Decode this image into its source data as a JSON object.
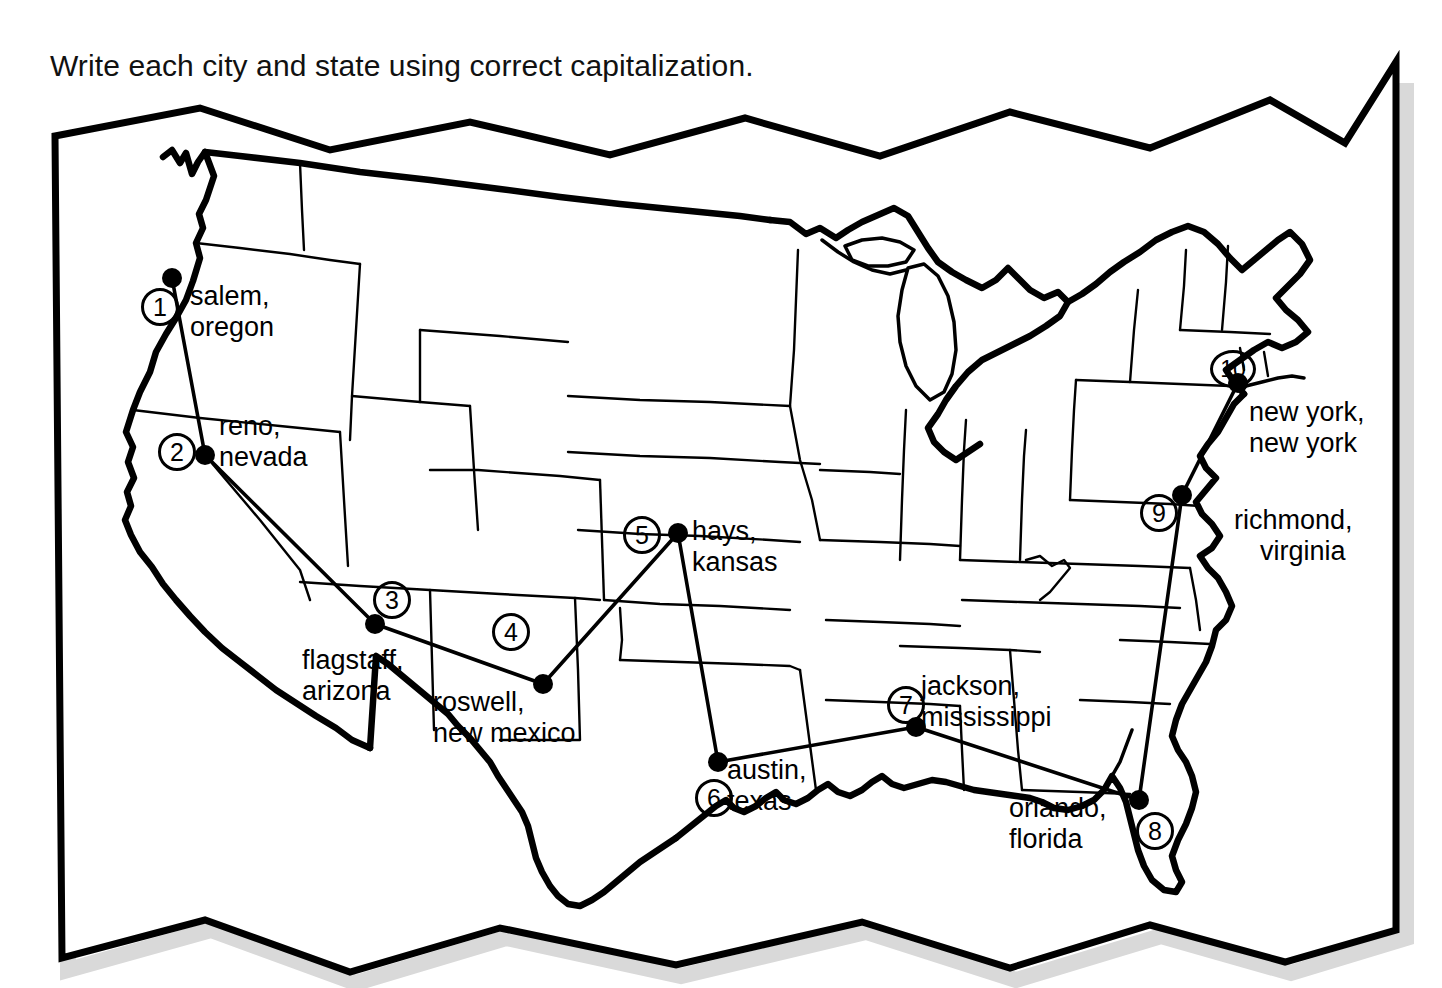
{
  "worksheet": {
    "instruction": "Write each city and state using correct capitalization.",
    "background_color": "#ffffff",
    "ink_color": "#000000"
  },
  "map": {
    "title": "United States outline map",
    "frame_style": "zigzag-banner",
    "markers": [
      {
        "number": "1",
        "city": "salem,",
        "state": "oregon",
        "dot_x": 172,
        "dot_y": 278,
        "badge_x": 141,
        "badge_y": 288,
        "label_x": 190,
        "label_y": 281
      },
      {
        "number": "2",
        "city": "reno,",
        "state": "nevada",
        "dot_x": 205,
        "dot_y": 455,
        "badge_x": 158,
        "badge_y": 433,
        "label_x": 219,
        "label_y": 411
      },
      {
        "number": "3",
        "city": "flagstaff,",
        "state": "arizona",
        "dot_x": 375,
        "dot_y": 624,
        "badge_x": 373,
        "badge_y": 581,
        "label_x": 302,
        "label_y": 645
      },
      {
        "number": "4",
        "city": "roswell,",
        "state": "new mexico",
        "dot_x": 543,
        "dot_y": 684,
        "badge_x": 492,
        "badge_y": 613,
        "label_x": 433,
        "label_y": 687
      },
      {
        "number": "5",
        "city": "hays,",
        "state": "kansas",
        "dot_x": 678,
        "dot_y": 533,
        "badge_x": 623,
        "badge_y": 516,
        "label_x": 692,
        "label_y": 516
      },
      {
        "number": "6",
        "city": "austin,",
        "state": "texas",
        "dot_x": 718,
        "dot_y": 762,
        "badge_x": 695,
        "badge_y": 779,
        "label_x": 727,
        "label_y": 755
      },
      {
        "number": "7",
        "city": "jackson,",
        "state": "mississippi",
        "dot_x": 916,
        "dot_y": 727,
        "badge_x": 887,
        "badge_y": 686,
        "label_x": 921,
        "label_y": 671
      },
      {
        "number": "8",
        "city": "orlando,",
        "state": "florida",
        "dot_x": 1139,
        "dot_y": 800,
        "badge_x": 1136,
        "badge_y": 812,
        "label_x": 1009,
        "label_y": 793
      },
      {
        "number": "9",
        "city": "richmond,",
        "state": "virginia",
        "dot_x": 1182,
        "dot_y": 495,
        "badge_x": 1140,
        "badge_y": 494,
        "label_x": 1234,
        "label_y": 505
      },
      {
        "number": "10",
        "city": "new york,",
        "state": "new york",
        "dot_x": 1238,
        "dot_y": 383,
        "badge_x": 1210,
        "badge_y": 350,
        "label_x": 1249,
        "label_y": 397
      }
    ],
    "connection_order": [
      "1",
      "2",
      "3",
      "4",
      "5",
      "6",
      "7",
      "8",
      "9",
      "10"
    ]
  }
}
